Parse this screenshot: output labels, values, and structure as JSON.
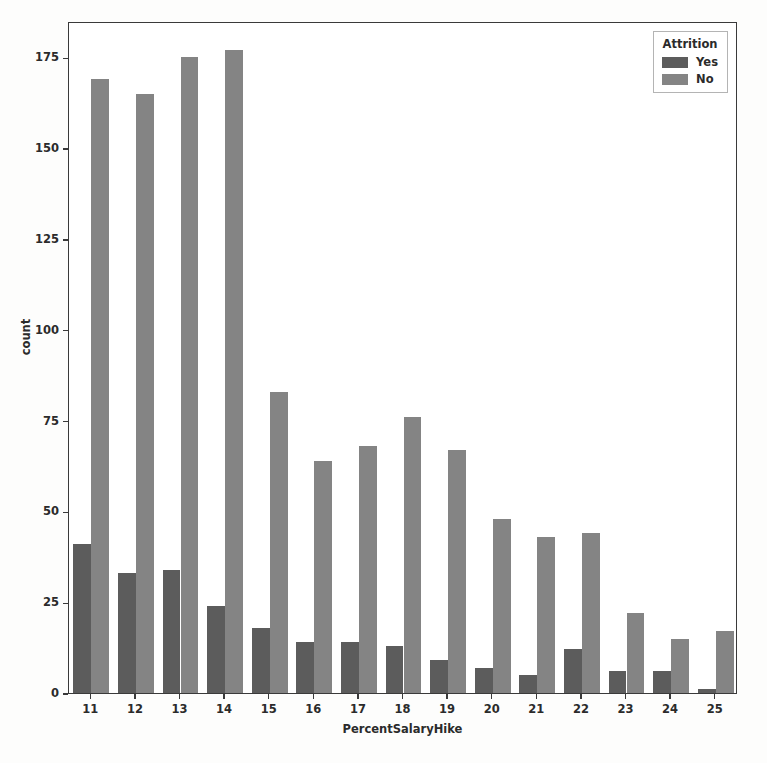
{
  "chart_data": {
    "type": "bar",
    "title": "",
    "xlabel": "PercentSalaryHike",
    "ylabel": "count",
    "categories": [
      "11",
      "12",
      "13",
      "14",
      "15",
      "16",
      "17",
      "18",
      "19",
      "20",
      "21",
      "22",
      "23",
      "24",
      "25"
    ],
    "series": [
      {
        "name": "Yes",
        "color": "#5c5c5c",
        "values": [
          41,
          33,
          34,
          24,
          18,
          14,
          14,
          13,
          9,
          7,
          5,
          12,
          6,
          6,
          1
        ]
      },
      {
        "name": "No",
        "color": "#848484",
        "values": [
          169,
          165,
          175,
          177,
          83,
          64,
          68,
          76,
          67,
          48,
          43,
          44,
          22,
          15,
          17
        ]
      }
    ],
    "ylim": [
      0,
      185
    ],
    "yticks": [
      0,
      25,
      50,
      75,
      100,
      125,
      150,
      175
    ],
    "ytick_labels": [
      "0",
      "25",
      "50",
      "75",
      "100",
      "125",
      "150",
      "175"
    ],
    "grid": false,
    "legend": {
      "title": "Attrition",
      "position": "upper right",
      "entries": [
        "Yes",
        "No"
      ]
    }
  }
}
